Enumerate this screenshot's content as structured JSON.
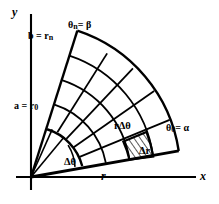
{
  "figure": {
    "type": "polar-region-diagram",
    "background_color": "#ffffff",
    "stroke_color": "#000000"
  },
  "axes": {
    "x_label": "x",
    "y_label": "y",
    "origin_x": 31,
    "origin_y": 177
  },
  "labels": {
    "outer_radius": "b = r",
    "outer_radius_sub": "n",
    "inner_radius": "a = r",
    "inner_radius_sub": "0",
    "upper_angle": "θ",
    "upper_angle_sub": "n",
    "upper_angle_rest": "= β",
    "lower_angle": "θ",
    "lower_angle_sub": "0",
    "lower_angle_rest": "= α",
    "delta_theta": "Δθ",
    "radius_r": "r",
    "arc_length": "rΔθ",
    "delta_r": "Δr"
  },
  "geometry": {
    "r_inner": 52,
    "r_outer": 150,
    "theta_start_deg": 10,
    "theta_end_deg": 72,
    "radial_arcs": [
      52,
      76,
      100,
      124,
      150
    ],
    "angular_rays_deg": [
      10,
      22.4,
      34.8,
      47.2,
      59.6,
      72
    ],
    "shaded_cell": {
      "r_from": 100,
      "r_to": 124,
      "theta_from_deg": 10,
      "theta_to_deg": 22.4,
      "hatch": "diagonal"
    }
  }
}
